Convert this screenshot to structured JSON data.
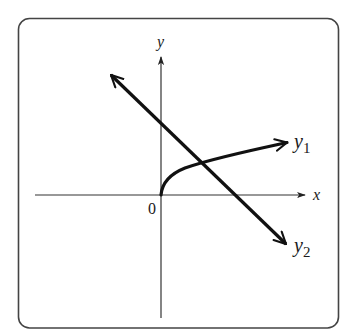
{
  "diagram": {
    "type": "function-graph",
    "frame": {
      "x": 18,
      "y": 18,
      "width": 321,
      "height": 310,
      "radius": 11,
      "stroke": "#444444"
    },
    "axes": {
      "origin": {
        "x": 161,
        "y": 195
      },
      "x_axis": {
        "from": 35,
        "to": 305,
        "label": "x"
      },
      "y_axis": {
        "from": 318,
        "to": 57,
        "label": "y"
      },
      "origin_label": "0"
    },
    "curves": [
      {
        "name": "y1",
        "label": "y",
        "subscript": "1",
        "shape": "square-root",
        "description": "increasing concave curve starting at origin, arrow to the right"
      },
      {
        "name": "y2",
        "label": "y",
        "subscript": "2",
        "shape": "line",
        "description": "decreasing straight line with arrows at both ends"
      }
    ],
    "colors": {
      "stroke": "#111111",
      "axis": "#333333",
      "frame": "#444444",
      "background": "#ffffff"
    }
  }
}
